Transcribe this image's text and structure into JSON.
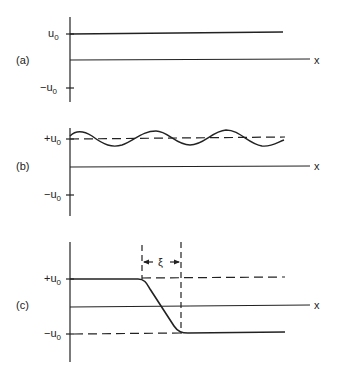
{
  "panels": [
    {
      "id": "a",
      "label": "(a)",
      "axis_label_x": "x",
      "ticks": {
        "top": "u",
        "top_sub": "0",
        "bottom": "−u",
        "bottom_sub": "0"
      },
      "description": "constant solution u = u0"
    },
    {
      "id": "b",
      "label": "(b)",
      "axis_label_x": "x",
      "ticks": {
        "top": "+u",
        "top_sub": "0",
        "bottom": "−u",
        "bottom_sub": "0"
      },
      "description": "small sinusoidal perturbation about +u0"
    },
    {
      "id": "c",
      "label": "(c)",
      "axis_label_x": "x",
      "ticks": {
        "top": "+u",
        "top_sub": "0",
        "bottom": "−u",
        "bottom_sub": "0"
      },
      "width_label": "ξ",
      "description": "kink transition from +u0 to −u0 over width ξ"
    }
  ]
}
